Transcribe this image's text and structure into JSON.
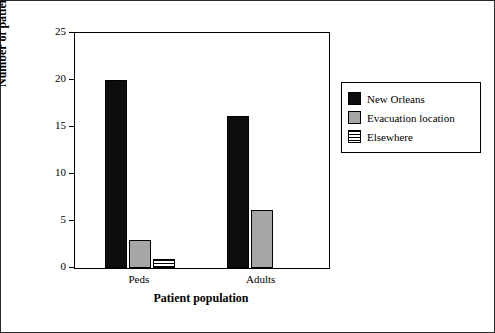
{
  "chart_data": {
    "type": "bar",
    "title": "",
    "xlabel": "Patient population",
    "ylabel": "Number of patients",
    "categories": [
      "Peds",
      "Adults"
    ],
    "series": [
      {
        "name": "New Orleans",
        "values": [
          20,
          16.2
        ],
        "color": "#0d0d0d"
      },
      {
        "name": "Evacuation location",
        "values": [
          3,
          6.2
        ],
        "color": "#a6a6a6"
      },
      {
        "name": "Elsewhere",
        "values": [
          1,
          0
        ],
        "color": "#ffffff"
      }
    ],
    "ylim": [
      0,
      25
    ],
    "yticks": [
      0,
      5,
      10,
      15,
      20,
      25
    ],
    "ytick_labels": [
      "0",
      "5",
      "10",
      "15",
      "20",
      "25"
    ],
    "grid": false,
    "legend_position": "right"
  },
  "legend": {
    "entries": [
      {
        "label": "New Orleans"
      },
      {
        "label": "Evacuation location"
      },
      {
        "label": "Elsewhere"
      }
    ]
  }
}
